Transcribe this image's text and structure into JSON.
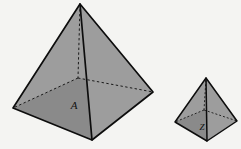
{
  "figure": {
    "type": "geometry-illustration",
    "background_color": "#f4f4f2",
    "face_fill_color": "#9d9d9d",
    "face_fill_color_dark": "#8a8a8a",
    "edge_color": "#0d0d0d",
    "hidden_edge_color": "#1a1a1a",
    "shapes": [
      {
        "name": "large-pyramid",
        "label": "A",
        "label_position": {
          "x": 74,
          "y": 106
        },
        "label_font_size": 11,
        "stroke_width": 1.7,
        "hidden_stroke_width": 1.0,
        "hidden_dash": "2.4,2.4",
        "vertices": {
          "apex": {
            "x": 80,
            "y": 4
          },
          "front_left": {
            "x": 13,
            "y": 108
          },
          "front_bottom": {
            "x": 92,
            "y": 140
          },
          "front_right": {
            "x": 153,
            "y": 92
          },
          "back_hidden": {
            "x": 78,
            "y": 78
          }
        }
      },
      {
        "name": "small-pyramid",
        "label": "Z",
        "label_position": {
          "x": 202,
          "y": 128
        },
        "label_font_size": 9,
        "stroke_width": 1.5,
        "hidden_stroke_width": 0.9,
        "hidden_dash": "2,2",
        "vertices": {
          "apex": {
            "x": 206,
            "y": 78
          },
          "front_left": {
            "x": 175,
            "y": 122
          },
          "front_bottom": {
            "x": 207,
            "y": 141
          },
          "front_right": {
            "x": 237,
            "y": 121
          },
          "back_hidden": {
            "x": 204,
            "y": 110
          }
        }
      }
    ]
  }
}
